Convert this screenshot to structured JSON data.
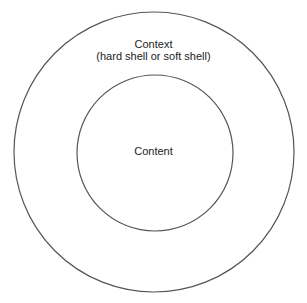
{
  "diagram": {
    "type": "nested-circles",
    "outer": {
      "title": "Context",
      "subtitle": "(hard shell or soft shell)"
    },
    "inner": {
      "title": "Content"
    },
    "stroke_color": "#555555",
    "text_color": "#222222",
    "background": "#ffffff"
  }
}
